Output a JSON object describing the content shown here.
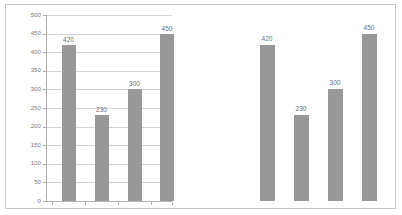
{
  "chart_data": [
    {
      "type": "bar",
      "title": "",
      "xlabel": "",
      "ylabel": "",
      "categories": [
        "1",
        "2",
        "3",
        "4"
      ],
      "values": [
        420,
        230,
        300,
        450
      ],
      "data_labels": [
        "420",
        "230",
        "300",
        "450"
      ],
      "ylim": [
        0,
        500
      ],
      "yticks": [
        0,
        50,
        100,
        150,
        200,
        250,
        300,
        350,
        400,
        450,
        500
      ],
      "ytick_labels": [
        "0",
        "50",
        "100",
        "150",
        "200",
        "250",
        "300",
        "350",
        "400",
        "450",
        "500"
      ],
      "grid": true,
      "legend": "none",
      "bar_color": "#989898",
      "gridline_color": "#d4d4d4",
      "axis_color": "#b0b0b0"
    },
    {
      "type": "bar",
      "title": "",
      "xlabel": "",
      "ylabel": "",
      "categories": [
        "1",
        "2",
        "3",
        "4"
      ],
      "values": [
        420,
        230,
        300,
        450
      ],
      "data_labels": [
        "420",
        "230",
        "300",
        "450"
      ],
      "ylim": [
        0,
        500
      ],
      "yticks": [],
      "ytick_labels": [],
      "grid": false,
      "legend": "none",
      "bar_color": "#989898",
      "gridline_color": "none",
      "axis_color": "#e2e2e2"
    }
  ],
  "figure": {
    "border_color": "#c9c9c9",
    "background": "#ffffff"
  }
}
